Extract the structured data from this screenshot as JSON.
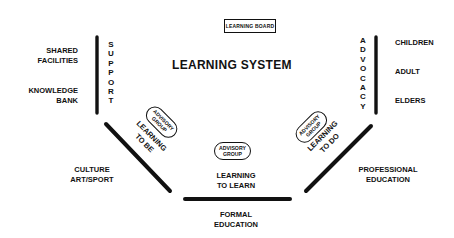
{
  "header": {
    "board_label": "LEARNING BOARD",
    "title": "LEARNING SYSTEM"
  },
  "left_column": {
    "items": [
      "SHARED FACILITIES",
      "KNOWLEDGE BANK"
    ],
    "item1_line1": "SHARED",
    "item1_line2": "FACILITIES",
    "item2_line1": "KNOWLEDGE",
    "item2_line2": "BANK",
    "bar_label": "SUPPORT"
  },
  "right_column": {
    "items": [
      "CHILDREN",
      "ADULT",
      "ELDERS"
    ],
    "bar_label": "ADVOCACY"
  },
  "segments": {
    "left_diagonal": {
      "inner_line1": "LEARNING",
      "inner_line2": "TO BE",
      "advisory_line1": "ADVISORY",
      "advisory_line2": "GROUP",
      "outer_line1": "CULTURE",
      "outer_line2": "ART/SPORT"
    },
    "bottom": {
      "inner_line1": "LEARNING",
      "inner_line2": "TO LEARN",
      "advisory_line1": "ADVISORY",
      "advisory_line2": "GROUP",
      "outer_line1": "FORMAL",
      "outer_line2": "EDUCATION"
    },
    "right_diagonal": {
      "inner_line1": "LEARNING",
      "inner_line2": "TO DO",
      "advisory_line1": "ADVISORY",
      "advisory_line2": "GROUP",
      "outer_line1": "PROFESSIONAL",
      "outer_line2": "EDUCATION"
    }
  },
  "colors": {
    "ink": "#111111",
    "background": "#ffffff"
  }
}
